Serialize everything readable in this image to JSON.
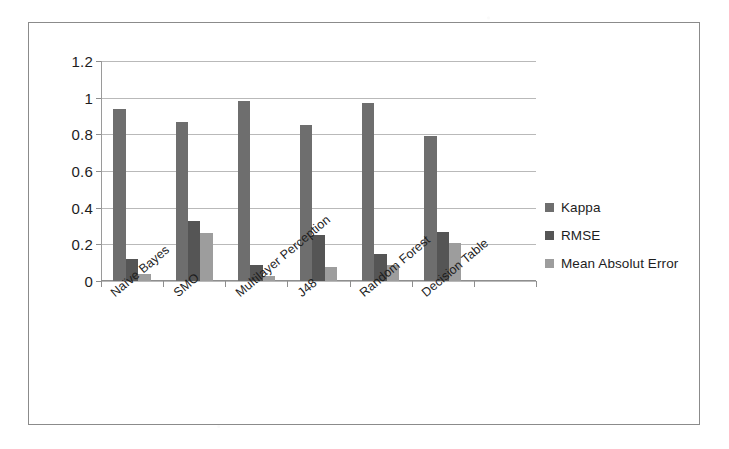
{
  "chart_data": {
    "type": "bar",
    "title": "",
    "subtitle": "",
    "xlabel": "",
    "ylabel": "",
    "categories": [
      "Naïve Bayes",
      "SMO",
      "Multilayer Perception",
      "J48",
      "Random Forest",
      "Decision Table"
    ],
    "series": [
      {
        "name": "Kappa",
        "color": "#6e6e6e",
        "values": [
          0.94,
          0.87,
          0.98,
          0.85,
          0.97,
          0.79
        ]
      },
      {
        "name": "RMSE",
        "color": "#555555",
        "values": [
          0.12,
          0.33,
          0.09,
          0.25,
          0.145,
          0.27
        ]
      },
      {
        "name": "Mean Absolut Error",
        "color": "#9d9d9d",
        "values": [
          0.04,
          0.26,
          0.025,
          0.075,
          0.09,
          0.21
        ]
      }
    ],
    "ylim": [
      0,
      1.2
    ],
    "ytick_labels": [
      "0",
      "0.2",
      "0.4",
      "0.6",
      "0.8",
      "1",
      "1.2"
    ],
    "ytick_values": [
      0,
      0.2,
      0.4,
      0.6,
      0.8,
      1,
      1.2
    ],
    "grid": true,
    "legend_position": "right",
    "empty_trailing_category_slot": true
  },
  "legend": {
    "items": [
      {
        "label": "Kappa",
        "color": "#6e6e6e"
      },
      {
        "label": "RMSE",
        "color": "#555555"
      },
      {
        "label": "Mean Absolut Error",
        "color": "#9d9d9d"
      }
    ]
  }
}
